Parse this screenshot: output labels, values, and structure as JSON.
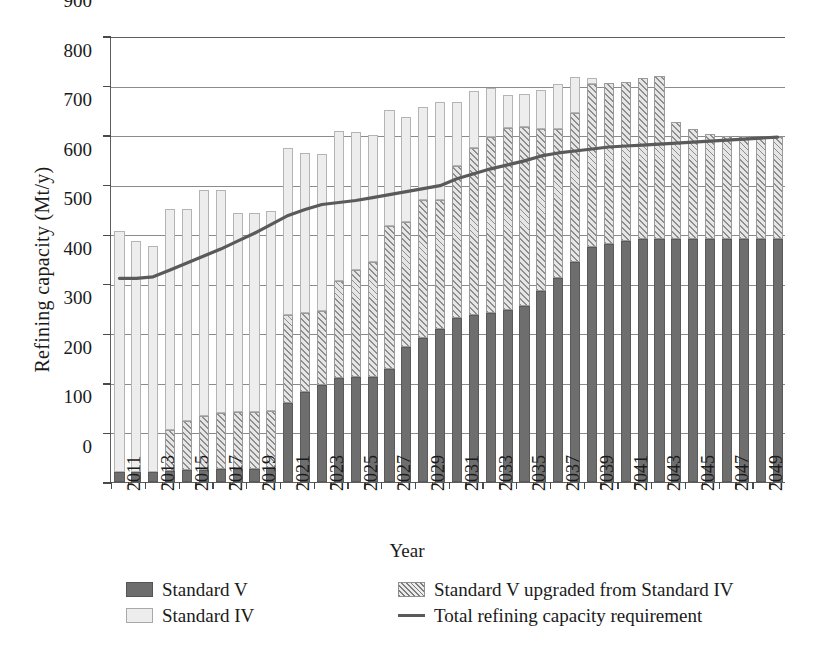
{
  "chart_data": {
    "type": "bar",
    "subtype": "stacked-bar-with-line",
    "title": "",
    "xlabel": "Year",
    "ylabel": "Refining capacity  (Mt/y)",
    "ylim": [
      0,
      900
    ],
    "ytick_step": 100,
    "yticks": [
      0,
      100,
      200,
      300,
      400,
      500,
      600,
      700,
      800,
      900
    ],
    "grid": true,
    "legend_position": "bottom",
    "x": [
      2011,
      2012,
      2013,
      2014,
      2015,
      2016,
      2017,
      2018,
      2019,
      2020,
      2021,
      2022,
      2023,
      2024,
      2025,
      2026,
      2027,
      2028,
      2029,
      2030,
      2031,
      2032,
      2033,
      2034,
      2035,
      2036,
      2037,
      2038,
      2039,
      2040,
      2041,
      2042,
      2043,
      2044,
      2045,
      2046,
      2047,
      2048,
      2049,
      2050
    ],
    "xtick_labels": [
      "2011",
      "2013",
      "2015",
      "2017",
      "2019",
      "2021",
      "2023",
      "2025",
      "2027",
      "2029",
      "2031",
      "2033",
      "2035",
      "2037",
      "2039",
      "2041",
      "2043",
      "2045",
      "2047",
      "2049"
    ],
    "series": [
      {
        "name": "Standard V",
        "style": "solid-dark",
        "color": "#6e6e6e",
        "values": [
          20,
          20,
          20,
          22,
          24,
          24,
          26,
          26,
          26,
          28,
          160,
          182,
          196,
          210,
          212,
          212,
          228,
          272,
          290,
          308,
          330,
          338,
          342,
          348,
          356,
          386,
          412,
          444,
          474,
          480,
          486,
          490,
          490,
          490,
          490,
          490,
          490,
          490,
          490,
          490
        ]
      },
      {
        "name": "Standard V upgraded from Standard IV",
        "style": "diagonal-hatch",
        "color": "#8d8d8d",
        "values": [
          0,
          0,
          0,
          82,
          100,
          110,
          114,
          116,
          116,
          116,
          178,
          160,
          150,
          196,
          216,
          232,
          288,
          252,
          280,
          262,
          308,
          336,
          354,
          366,
          360,
          326,
          300,
          300,
          330,
          326,
          322,
          326,
          330,
          236,
          222,
          212,
          208,
          208,
          206,
          206
        ]
      },
      {
        "name": "Standard IV",
        "style": "light-fill",
        "color": "#ededed",
        "values": [
          486,
          466,
          456,
          446,
          426,
          456,
          450,
          400,
          400,
          402,
          336,
          322,
          316,
          302,
          278,
          256,
          234,
          212,
          186,
          196,
          128,
          116,
          100,
          66,
          66,
          80,
          92,
          74,
          12,
          0,
          0,
          0,
          0,
          0,
          0,
          0,
          0,
          0,
          0,
          0
        ]
      }
    ],
    "totals": [
      506,
      486,
      476,
      550,
      550,
      570,
      582,
      592,
      542,
      544,
      674,
      664,
      662,
      708,
      706,
      700,
      724,
      744,
      732,
      754,
      766,
      790,
      796,
      780,
      782,
      792,
      804,
      818,
      816,
      806,
      808,
      816,
      820,
      726,
      712,
      702,
      698,
      698,
      696,
      696
    ],
    "line_series": {
      "name": "Total refining capacity requirement",
      "style": "line",
      "color": "#5a5a5a",
      "values": [
        413,
        413,
        416,
        430,
        444,
        458,
        472,
        488,
        504,
        522,
        540,
        552,
        562,
        566,
        570,
        576,
        582,
        588,
        594,
        600,
        614,
        624,
        634,
        642,
        650,
        660,
        666,
        670,
        674,
        678,
        680,
        682,
        684,
        686,
        688,
        690,
        692,
        694,
        696,
        698
      ]
    }
  },
  "legend": {
    "items": [
      {
        "label": "Standard V",
        "swatch": "solid-dark-swatch"
      },
      {
        "label": "Standard V upgraded from Standard IV",
        "swatch": "hatch-swatch"
      },
      {
        "label": "Standard IV",
        "swatch": "light-swatch"
      },
      {
        "label": "Total refining capacity requirement",
        "swatch": "line-swatch"
      }
    ]
  }
}
